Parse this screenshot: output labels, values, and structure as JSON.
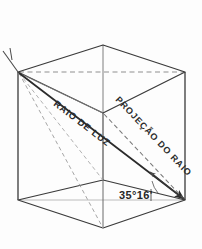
{
  "figure": {
    "kind": "axonometric-cube-light-ray-diagram",
    "background_color": "#fdfdfd",
    "ink_color": "#3a3a3a",
    "heavy_ink_color": "#2b2b2b",
    "faint_ink_color": "#9a9a9a",
    "labels": {
      "ray": "RAIO DE LUZ",
      "projection": "PROJEÇÃO DO RAIO",
      "angle": "35°16'"
    },
    "geometry": {
      "note": "cube drawn in oblique/axonometric view",
      "vertices": {
        "top_back": [
          103,
          45
        ],
        "top_left": [
          18,
          72
        ],
        "top_right": [
          185,
          72
        ],
        "top_front": [
          103,
          113
        ],
        "bottom_left": [
          18,
          200
        ],
        "bottom_right": [
          185,
          200
        ],
        "bottom_front": [
          103,
          228
        ],
        "bottom_center": [
          103,
          180
        ]
      }
    },
    "annotations": [
      {
        "name": "light-ray",
        "style": "solid-heavy",
        "from": "top_left",
        "to": "bottom_right"
      },
      {
        "name": "ray-projection",
        "style": "dashed",
        "from": "top_front",
        "to": "bottom_right"
      },
      {
        "name": "angle-arrow",
        "style": "arrowhead",
        "at": [
          152,
          175
        ]
      },
      {
        "name": "top-face-diagonal",
        "style": "dashed",
        "from": "top_left",
        "to": "top_right"
      },
      {
        "name": "corner-tick",
        "style": "short-stub",
        "at": [
          6,
          52
        ]
      }
    ]
  }
}
